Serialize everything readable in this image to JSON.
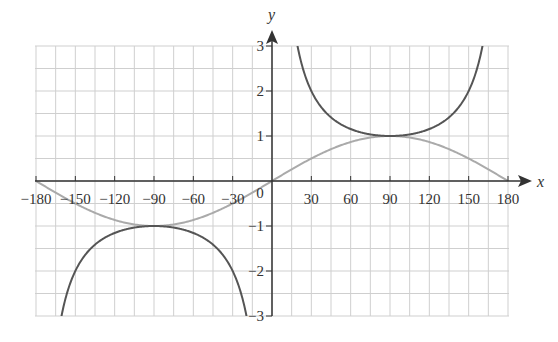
{
  "chart_data": {
    "type": "line",
    "title": "",
    "xlabel": "x",
    "ylabel": "y",
    "xlim": [
      -180,
      180
    ],
    "ylim": [
      -3,
      3
    ],
    "grid": true,
    "x_ticks": [
      -180,
      -150,
      -120,
      -90,
      -60,
      -30,
      0,
      30,
      60,
      90,
      120,
      150,
      180
    ],
    "x_tick_labels": [
      "-180",
      "-150",
      "-120",
      "-90",
      "-60",
      "-30",
      "0",
      "30",
      "60",
      "90",
      "120",
      "150",
      "180"
    ],
    "y_ticks": [
      -3,
      -2,
      -1,
      1,
      2,
      3
    ],
    "y_tick_labels": [
      "-3",
      "-2",
      "-1",
      "1",
      "2",
      "3"
    ],
    "origin_label": "0",
    "series": [
      {
        "name": "y = sin x",
        "color": "#aaaaaa",
        "function": "sin",
        "points": [
          [
            -180,
            0
          ],
          [
            -150,
            -0.5
          ],
          [
            -120,
            -0.87
          ],
          [
            -90,
            -1
          ],
          [
            -60,
            -0.87
          ],
          [
            -30,
            -0.5
          ],
          [
            0,
            0
          ],
          [
            30,
            0.5
          ],
          [
            60,
            0.87
          ],
          [
            90,
            1
          ],
          [
            120,
            0.87
          ],
          [
            150,
            0.5
          ],
          [
            180,
            0
          ]
        ]
      },
      {
        "name": "y = cosec x",
        "color": "#555555",
        "function": "cosec",
        "points": [
          [
            -160,
            -2.92
          ],
          [
            -150,
            -2
          ],
          [
            -120,
            -1.15
          ],
          [
            -90,
            -1
          ],
          [
            -60,
            -1.15
          ],
          [
            -30,
            -2
          ],
          [
            -20,
            -2.92
          ],
          [
            20,
            2.92
          ],
          [
            30,
            2
          ],
          [
            60,
            1.15
          ],
          [
            90,
            1
          ],
          [
            120,
            1.15
          ],
          [
            150,
            2
          ],
          [
            160,
            2.92
          ]
        ]
      }
    ],
    "legend": null
  },
  "colors": {
    "grid": "#cfcfcf",
    "axis": "#333333",
    "sin": "#aaaaaa",
    "cosec": "#555555"
  }
}
